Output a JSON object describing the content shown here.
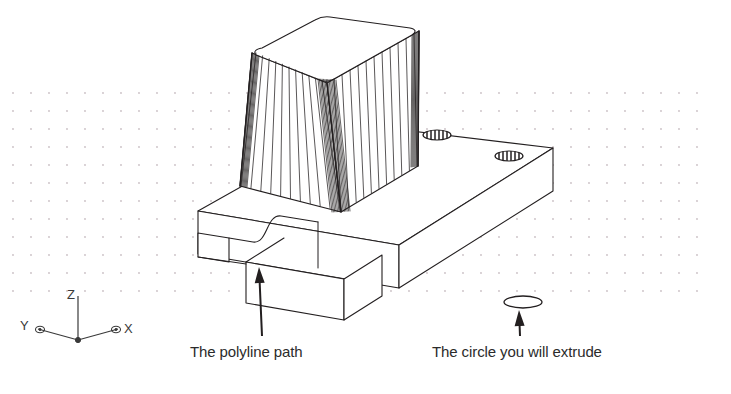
{
  "figure": {
    "background_color": "#ffffff",
    "line_color": "#231f20",
    "grid_dot_color": "#c9bfc4",
    "text_color": "#2b2b2b"
  },
  "grid": {
    "name": "snap-grid",
    "dot_spacing_x": 18,
    "dot_spacing_y": 18,
    "origin_x": 13,
    "origin_y": 93,
    "columns": 39,
    "rows": 12,
    "dot_radius": 0.9,
    "color": "#c9bfc4"
  },
  "axis_indicator": {
    "name": "ucs-axis-tripod",
    "origin_x": 78,
    "origin_y": 340,
    "z_label": "Z",
    "x_label": "X",
    "y_label": "Y",
    "z_length": 44,
    "arm_length": 40,
    "color": "#3a3a3a"
  },
  "annotations": [
    {
      "id": "polyline-path",
      "label": "The polyline path",
      "text_x": 190,
      "text_y": 357,
      "arrow_from_x": 262,
      "arrow_from_y": 336,
      "arrow_to_x": 259,
      "arrow_to_y": 267
    },
    {
      "id": "circle-to-extrude",
      "label": "The circle you will extrude",
      "text_x": 432,
      "text_y": 357,
      "arrow_from_x": 520,
      "arrow_from_y": 336,
      "arrow_to_x": 519,
      "arrow_to_y": 310
    }
  ],
  "circle_profile": {
    "name": "extrude-circle",
    "center_x": 523,
    "center_y": 302,
    "radius_x": 19,
    "radius_y": 6
  },
  "holes": [
    {
      "name": "top-hole-left",
      "center_x": 437,
      "center_y": 135,
      "radius_x": 14,
      "radius_y": 5,
      "hatch_lines": 7
    },
    {
      "name": "top-hole-right",
      "center_x": 509,
      "center_y": 156,
      "radius_x": 14,
      "radius_y": 5,
      "hatch_lines": 7
    }
  ],
  "solid": {
    "name": "base-slab-with-frustum",
    "description": "Rectangular base slab with stepped foot, S-curved polyline groove, two through holes, and a tessellated tapered frustum boss on top",
    "frustum": {
      "name": "tapered-frustum-boss",
      "tessellation_line_count": 26,
      "top_face_corner_radius": 10
    }
  }
}
